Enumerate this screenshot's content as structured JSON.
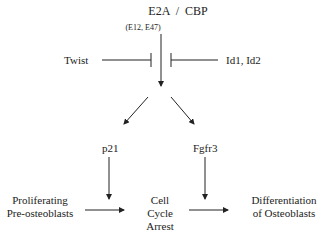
{
  "diagram": {
    "nodes": {
      "e2a_cbp": "E2A  /  CBP",
      "e2a_sub": "(E12, E47)",
      "twist": "Twist",
      "id": "Id1, Id2",
      "p21": "p21",
      "fgfr3": "Fgfr3",
      "proliferating": [
        "Proliferating",
        "Pre-osteoblasts"
      ],
      "arrest": [
        "Cell",
        "Cycle",
        "Arrest"
      ],
      "differentiation": [
        "Differentiation",
        "of Osteoblasts"
      ]
    },
    "edges": [
      {
        "from": "e2a_cbp",
        "to": "split",
        "type": "activation"
      },
      {
        "from": "twist",
        "to": "e2a_cbp",
        "type": "inhibition"
      },
      {
        "from": "id",
        "to": "e2a_cbp",
        "type": "inhibition"
      },
      {
        "from": "split",
        "to": "p21",
        "type": "activation"
      },
      {
        "from": "split",
        "to": "fgfr3",
        "type": "activation"
      },
      {
        "from": "p21",
        "to": "arrest_left",
        "type": "activation"
      },
      {
        "from": "fgfr3",
        "to": "arrest_right",
        "type": "activation"
      },
      {
        "from": "proliferating",
        "to": "arrest",
        "type": "activation"
      },
      {
        "from": "arrest",
        "to": "differentiation",
        "type": "activation"
      }
    ]
  }
}
